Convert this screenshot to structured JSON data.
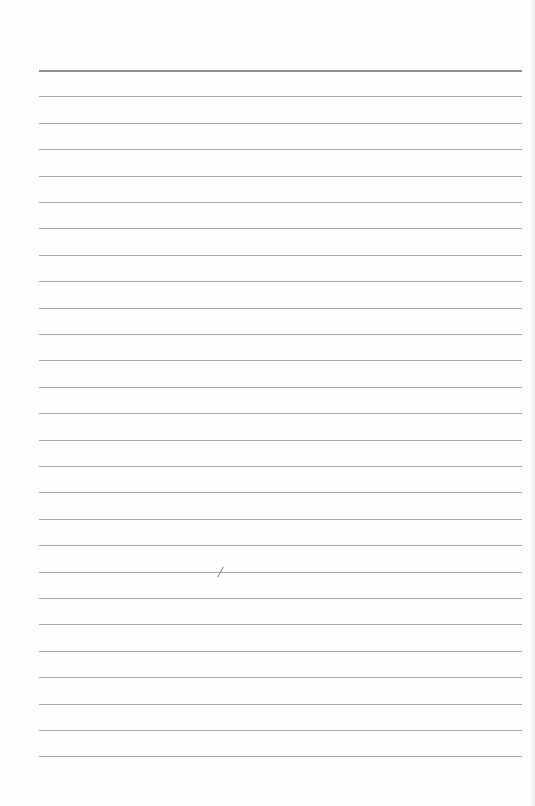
{
  "document": {
    "type": "lined-paper",
    "text": "",
    "rule_count": 27,
    "rule_first_y": 70,
    "rule_spacing": 26.4,
    "rule_left": 39,
    "rule_width": 483,
    "rule_color": "#a8a8a8",
    "top_rule_color": "#8f8f8f",
    "marks": [
      {
        "kind": "pencil-slash",
        "x": 220,
        "y": 566
      }
    ]
  }
}
